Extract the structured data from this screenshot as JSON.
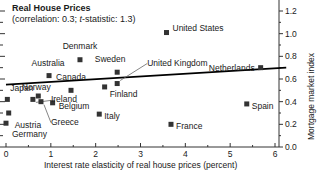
{
  "chart_data": {
    "type": "scatter",
    "title": "Real House Prices",
    "subtitle_prefix": "(correlation: 0.3; ",
    "subtitle_italic": "t",
    "subtitle_suffix": "-statistic: 1.3)",
    "xlabel": "Interest rate elasticity of real house prices (percent)",
    "ylabel": "Mortgage market index",
    "xlim": [
      0,
      6.25
    ],
    "ylim": [
      0,
      1.3
    ],
    "xticks": [
      0,
      1,
      2,
      3,
      4,
      5,
      6
    ],
    "xtick_labels": [
      "0",
      "1",
      "2",
      "3",
      "4",
      "5",
      "6"
    ],
    "yticks": [
      0.0,
      0.2,
      0.4,
      0.6,
      0.8,
      1.0,
      1.2
    ],
    "ytick_labels": [
      "0.0",
      "0.2",
      "0.4",
      "0.6",
      "0.8",
      "1.0",
      "1.2"
    ],
    "y_minor_ticks": [
      0.1,
      0.3,
      0.5,
      0.7,
      0.9,
      1.1,
      1.3
    ],
    "grid": false,
    "marker_color": "#333333",
    "line_color": "#000000",
    "axis_color": "#333333",
    "trendline": {
      "x0": 0.0,
      "y0": 0.55,
      "x1": 6.25,
      "y1": 0.7
    },
    "points": [
      {
        "name": "United States",
        "x": 3.58,
        "y": 1.01,
        "label_dx": 6,
        "label_dy": -4,
        "anchor": "start"
      },
      {
        "name": "Denmark",
        "x": 1.65,
        "y": 0.77,
        "label_dx": 0,
        "label_dy": -13,
        "anchor": "middle"
      },
      {
        "name": "Australia",
        "x": 0.96,
        "y": 0.63,
        "label_dx": -1,
        "label_dy": -12,
        "anchor": "middle"
      },
      {
        "name": "Canada",
        "x": 1.45,
        "y": 0.5,
        "label_dx": 0,
        "label_dy": -12,
        "anchor": "middle"
      },
      {
        "name": "Sweden",
        "x": 2.48,
        "y": 0.66,
        "label_dx": -7,
        "label_dy": -12,
        "anchor": "middle"
      },
      {
        "name": "United Kingdom",
        "x": 2.48,
        "y": 0.56,
        "label_dx": 30,
        "label_dy": -20,
        "anchor": "start",
        "leader": true
      },
      {
        "name": "Netherlands",
        "x": 5.68,
        "y": 0.7,
        "label_dx": -6,
        "label_dy": 1,
        "anchor": "end"
      },
      {
        "name": "Japan",
        "x": 0.03,
        "y": 0.42,
        "label_dx": 3,
        "label_dy": -10,
        "anchor": "start"
      },
      {
        "name": "Norway",
        "x": 0.72,
        "y": 0.45,
        "label_dx": -2,
        "label_dy": -8,
        "anchor": "middle"
      },
      {
        "name": "Finland",
        "x": 2.2,
        "y": 0.53,
        "label_dx": 5,
        "label_dy": 8,
        "anchor": "start"
      },
      {
        "name": "Ireland",
        "x": 0.6,
        "y": 0.42,
        "label_dx": 18,
        "label_dy": 1,
        "anchor": "start",
        "leader": true
      },
      {
        "name": "Belgium",
        "x": 1.04,
        "y": 0.39,
        "label_dx": 6,
        "label_dy": 4,
        "anchor": "start"
      },
      {
        "name": "Greece",
        "x": 0.78,
        "y": 0.4,
        "label_dx": 10,
        "label_dy": 21,
        "anchor": "start",
        "leader": true
      },
      {
        "name": "Austria",
        "x": 0.06,
        "y": 0.3,
        "label_dx": 6,
        "label_dy": 13,
        "anchor": "start"
      },
      {
        "name": "Germany",
        "x": 0.0,
        "y": 0.21,
        "label_dx": 6,
        "label_dy": 12,
        "anchor": "start"
      },
      {
        "name": "Italy",
        "x": 2.08,
        "y": 0.29,
        "label_dx": 5,
        "label_dy": 3,
        "anchor": "start"
      },
      {
        "name": "Spain",
        "x": 5.37,
        "y": 0.38,
        "label_dx": 5,
        "label_dy": 3,
        "anchor": "start"
      },
      {
        "name": "France",
        "x": 3.68,
        "y": 0.2,
        "label_dx": 5,
        "label_dy": 3,
        "anchor": "start"
      }
    ]
  }
}
